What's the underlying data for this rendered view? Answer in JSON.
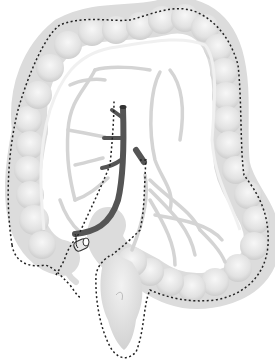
{
  "illustration": {
    "subject": "colon-anatomy-illustration",
    "colors": {
      "background": "#ffffff",
      "colon_fill": "#e2e2e2",
      "colon_highlight": "#f4f4f4",
      "colon_shadow": "#cfcfcf",
      "vessel_light": "#d6d6d6",
      "vessel_dark": "#555555",
      "dotted_outline": "#222222"
    },
    "elements": [
      "colon-body",
      "mesenteric-vessels",
      "dark-artery-trunk",
      "dark-artery-stub",
      "appendix",
      "terminal-ileum-stump",
      "rectum",
      "dotted-resection-outline"
    ]
  }
}
